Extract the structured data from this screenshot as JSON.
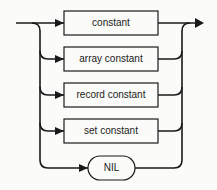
{
  "diagram": {
    "type": "syntax-diagram",
    "alternatives": [
      {
        "label": "constant",
        "shape": "box"
      },
      {
        "label": "array constant",
        "shape": "box"
      },
      {
        "label": "record constant",
        "shape": "box"
      },
      {
        "label": "set constant",
        "shape": "box"
      },
      {
        "label": "NIL",
        "shape": "rounded"
      }
    ],
    "colors": {
      "line": "#1a1a1a",
      "background": "#fbfbf9"
    }
  }
}
